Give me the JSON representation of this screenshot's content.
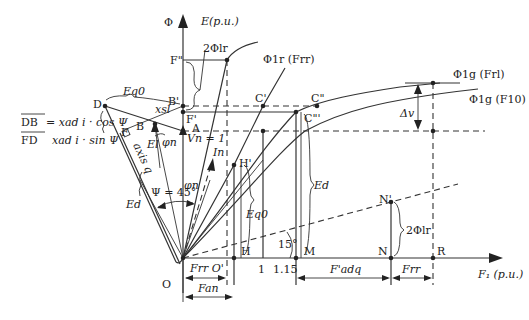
{
  "diagram": {
    "axes": {
      "y_axis_label": "Φ",
      "y_axis_unit_label": "E(p.u.)",
      "x_axis_label": "F₁ (p.u.)",
      "x_ticks": [
        "1",
        "1.15"
      ]
    },
    "points": {
      "O": "O",
      "O_prime": "O'",
      "A": "A",
      "B": "B",
      "B_prime": "B'",
      "C_prime": "C'",
      "C_dprime": "C\"",
      "C_tprime": "C\"'",
      "D": "D",
      "F": "F",
      "F_prime": "F'",
      "F_dprime": "F\"",
      "H": "H",
      "H_prime": "H'",
      "M": "M",
      "N": "N",
      "N_prime": "N'",
      "R": "R"
    },
    "curves": {
      "phi_1r": "Φ1r (Frr)",
      "phi_1g_frl": "Φ1g (Frl)",
      "phi_1g_f10": "Φ1g (F10)"
    },
    "quantities": {
      "two_phi_lr_top": "2Φlr",
      "two_phi_lr_right": "2Φlr",
      "E_q0_top": "Eq0",
      "E_q0_mid": "Eq0",
      "E_d_left": "Ed",
      "E_d_right": "Ed",
      "x_sl": "xsl",
      "E_l": "El",
      "phi_n_top": "φn",
      "phi_n_bottom": "φn",
      "V_n": "Vn = 1",
      "I_n": "In",
      "axis_q": "axis q",
      "psi": "Ψ = 45°",
      "delta_v": "Δv",
      "angle_15": "15°",
      "F_rr_O": "Frr O'",
      "F_an_phi": "Fan",
      "F_adq": "F'adq",
      "F_rr_right": "Frr"
    },
    "equations": {
      "eq1_lhs": "DB",
      "eq1_rhs": "= xad i · cos Ψ",
      "eq2_lhs": "FD",
      "eq2_rhs": "xad i · sin Ψ"
    }
  }
}
